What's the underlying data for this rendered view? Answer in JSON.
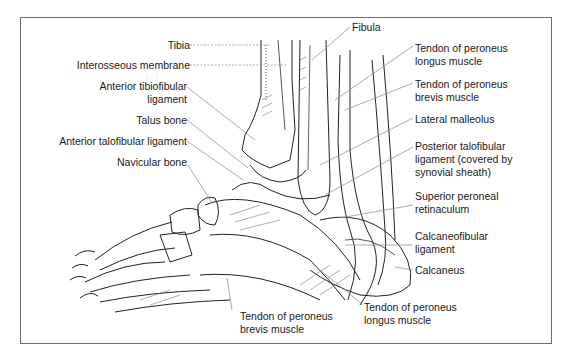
{
  "diagram": {
    "labels_left": [
      {
        "id": "tibia",
        "text": "Tibia"
      },
      {
        "id": "interosseous",
        "text": "Interosseous membrane"
      },
      {
        "id": "ant_tibiofibular_1",
        "text": "Anterior tibiofibular"
      },
      {
        "id": "ant_tibiofibular_2",
        "text": "ligament"
      },
      {
        "id": "talus",
        "text": "Talus bone"
      },
      {
        "id": "ant_talofibular",
        "text": "Anterior talofibular ligament"
      },
      {
        "id": "navicular",
        "text": "Navicular bone"
      }
    ],
    "labels_right": [
      {
        "id": "fibula",
        "text": "Fibula"
      },
      {
        "id": "pl_1",
        "text": "Tendon of peroneus"
      },
      {
        "id": "pl_2",
        "text": "longus muscle"
      },
      {
        "id": "pb_1",
        "text": "Tendon of peroneus"
      },
      {
        "id": "pb_2",
        "text": "brevis muscle"
      },
      {
        "id": "lat_mall",
        "text": "Lateral malleolus"
      },
      {
        "id": "ptf_1",
        "text": "Posterior talofibular"
      },
      {
        "id": "ptf_2",
        "text": "ligament (covered by"
      },
      {
        "id": "ptf_3",
        "text": "synovial sheath)"
      },
      {
        "id": "spr_1",
        "text": "Superior peroneal"
      },
      {
        "id": "spr_2",
        "text": "retinaculum"
      },
      {
        "id": "cf_1",
        "text": "Calcaneofibular"
      },
      {
        "id": "cf_2",
        "text": "ligament"
      },
      {
        "id": "calcaneus",
        "text": "Calcaneus"
      }
    ],
    "labels_bottom": [
      {
        "id": "bpb_1",
        "text": "Tendon of peroneus"
      },
      {
        "id": "bpb_2",
        "text": "brevis muscle"
      },
      {
        "id": "bpl_1",
        "text": "Tendon of peroneus"
      },
      {
        "id": "bpl_2",
        "text": "longus muscle"
      }
    ]
  }
}
